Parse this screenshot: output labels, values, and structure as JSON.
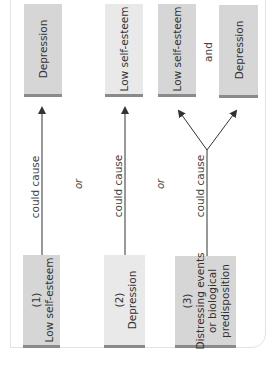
{
  "diagram": {
    "orientation": "rotated-90-ccw",
    "colors": {
      "box_fill": "#d6d6d6",
      "box_fill_light": "#e9e9e9",
      "box_edge": "#8a8a8a",
      "arrow": "#333333",
      "card_border": "#e3e3e3"
    },
    "columns": [
      {
        "cause": {
          "number": "(1)",
          "label": "Low self-esteem"
        },
        "relation": "could cause",
        "effects": [
          {
            "label": "Depression"
          }
        ]
      },
      {
        "cause": {
          "number": "(2)",
          "label": "Depression"
        },
        "relation": "could cause",
        "effects": [
          {
            "label": "Low self-esteem"
          }
        ]
      },
      {
        "cause": {
          "number": "(3)",
          "label_lines": [
            "Distressing events",
            "or biological",
            "predisposition"
          ]
        },
        "relation": "could cause",
        "effects": [
          {
            "label": "Low self-esteem"
          },
          {
            "label": "Depression"
          }
        ],
        "effects_joiner": "and"
      }
    ],
    "separators": [
      "or",
      "or"
    ]
  }
}
